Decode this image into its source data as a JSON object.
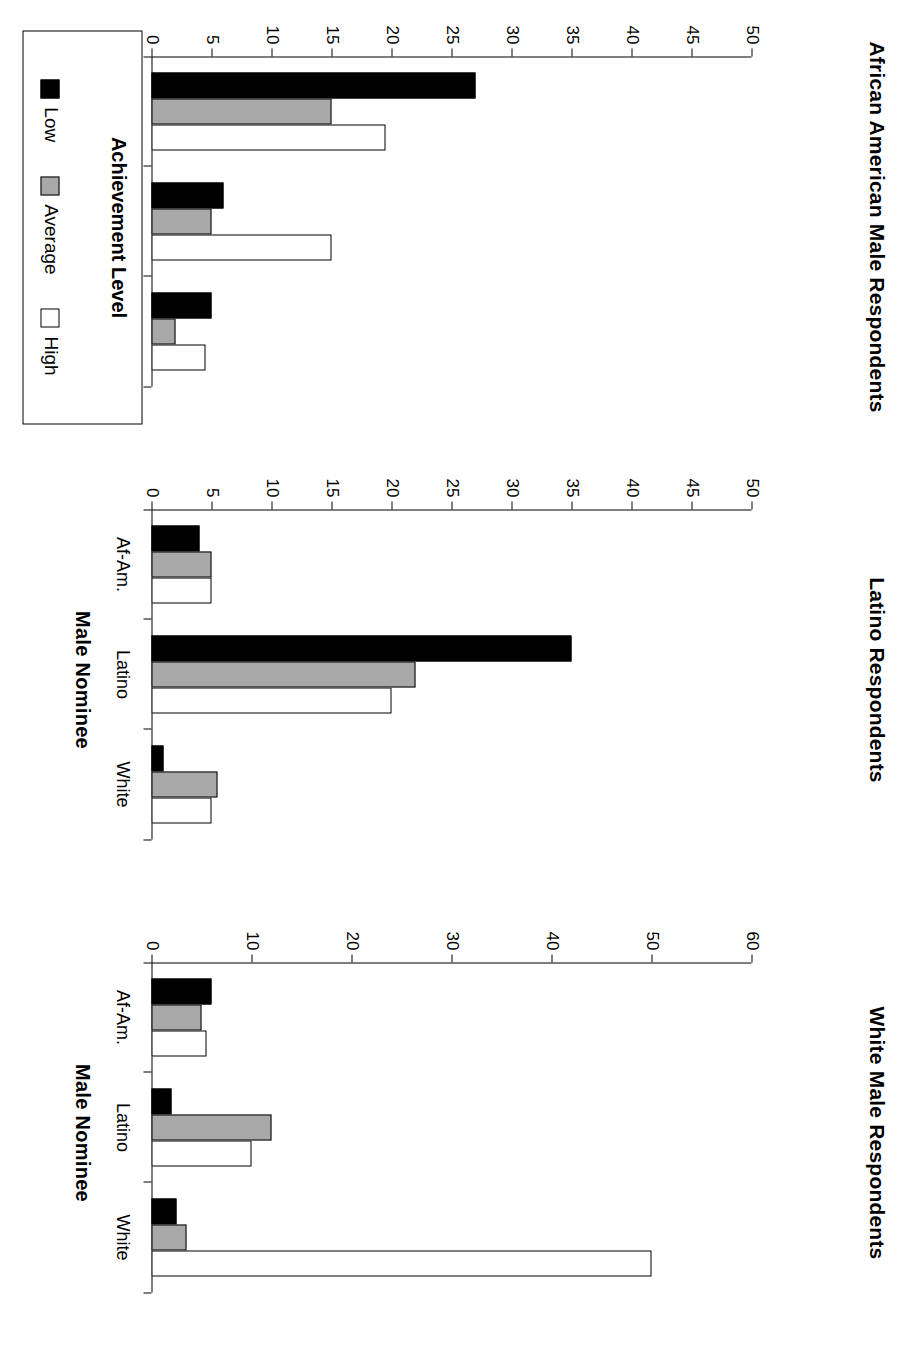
{
  "figure": {
    "xaxis_title": "Male Nominee",
    "legend": {
      "title": "Achievement Level",
      "items": [
        {
          "label": "Low",
          "color": "#000000"
        },
        {
          "label": "Average",
          "color": "#a8a8a8"
        },
        {
          "label": "High",
          "color": "#ffffff"
        }
      ]
    }
  },
  "chart_data": [
    {
      "type": "bar",
      "title": "African American Male Respondents",
      "xlabel": "Male Nominee",
      "ylabel": "",
      "categories": [
        "Af-Am.",
        "Latino",
        "White"
      ],
      "series": [
        {
          "name": "Low",
          "color": "#000000",
          "values": [
            27,
            6,
            5
          ]
        },
        {
          "name": "Average",
          "color": "#a8a8a8",
          "values": [
            15,
            5,
            2
          ]
        },
        {
          "name": "High",
          "color": "#ffffff",
          "values": [
            19.5,
            15,
            4.5
          ]
        }
      ],
      "ylim": [
        0,
        50
      ],
      "yticks": [
        0,
        5,
        10,
        15,
        20,
        25,
        30,
        35,
        40,
        45,
        50
      ],
      "grid": false,
      "legend_position": "below"
    },
    {
      "type": "bar",
      "title": "Latino Respondents",
      "xlabel": "Male Nominee",
      "ylabel": "",
      "categories": [
        "Af-Am.",
        "Latino",
        "White"
      ],
      "series": [
        {
          "name": "Low",
          "color": "#000000",
          "values": [
            4,
            35,
            1
          ]
        },
        {
          "name": "Average",
          "color": "#a8a8a8",
          "values": [
            5,
            22,
            5.5
          ]
        },
        {
          "name": "High",
          "color": "#ffffff",
          "values": [
            5,
            20,
            5
          ]
        }
      ],
      "ylim": [
        0,
        50
      ],
      "yticks": [
        0,
        5,
        10,
        15,
        20,
        25,
        30,
        35,
        40,
        45,
        50
      ],
      "grid": false,
      "legend_position": "none"
    },
    {
      "type": "bar",
      "title": "White Male Respondents",
      "xlabel": "Male Nominee",
      "ylabel": "",
      "categories": [
        "Af-Am.",
        "Latino",
        "White"
      ],
      "series": [
        {
          "name": "Low",
          "color": "#000000",
          "values": [
            6,
            2,
            2.5
          ]
        },
        {
          "name": "Average",
          "color": "#a8a8a8",
          "values": [
            5,
            12,
            3.5
          ]
        },
        {
          "name": "High",
          "color": "#ffffff",
          "values": [
            5.5,
            10,
            50
          ]
        }
      ],
      "ylim": [
        0,
        60
      ],
      "yticks": [
        0,
        10,
        20,
        30,
        40,
        50,
        60
      ],
      "grid": false,
      "legend_position": "none"
    }
  ]
}
